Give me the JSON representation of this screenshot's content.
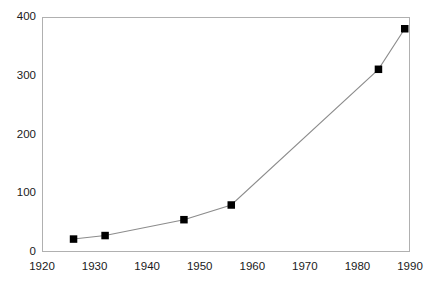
{
  "chart_data": {
    "type": "line",
    "title": "",
    "subtitle": "",
    "xlabel": "",
    "ylabel": "",
    "xlim": [
      1920,
      1990
    ],
    "ylim": [
      0,
      400
    ],
    "grid": false,
    "legend": false,
    "legend_position": "none",
    "marker": "filled-square",
    "marker_color": "#000000",
    "line_color": "#8c8c8c",
    "frame_color": "#b0b0b0",
    "x_ticks": [
      1920,
      1930,
      1940,
      1950,
      1960,
      1970,
      1980,
      1990
    ],
    "x_tick_labels": [
      "1920",
      "1930",
      "1940",
      "1950",
      "1960",
      "1970",
      "1980",
      "1990"
    ],
    "y_ticks": [
      0,
      100,
      200,
      300,
      400
    ],
    "y_tick_labels": [
      "0",
      "100",
      "200",
      "300",
      "400"
    ],
    "series": [
      {
        "name": "series-1",
        "x": [
          1926,
          1932,
          1947,
          1956,
          1984,
          1989
        ],
        "values": [
          22,
          28,
          55,
          80,
          311,
          380
        ]
      }
    ]
  }
}
